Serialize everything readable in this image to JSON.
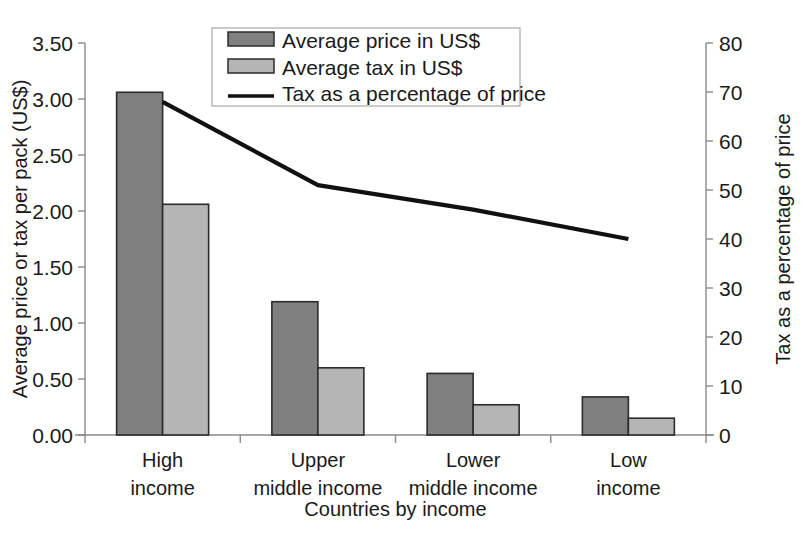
{
  "chart_data": {
    "type": "bar",
    "title": "",
    "subtitle": "",
    "xlabel": "Countries by income",
    "ylabel": "Average price or tax per pack (US$)",
    "y2label": "Tax as a percentage of price",
    "categories": [
      "High\nincome",
      "Upper\nmiddle income",
      "Lower\nmiddle income",
      "Low\nincome"
    ],
    "category_lines": [
      [
        "High",
        "income"
      ],
      [
        "Upper",
        "middle income"
      ],
      [
        "Lower",
        "middle income"
      ],
      [
        "Low",
        "income"
      ]
    ],
    "series": [
      {
        "name": "Average price in US$",
        "type": "bar",
        "axis": "left",
        "values": [
          3.06,
          1.19,
          0.55,
          0.34
        ],
        "color": "#808080"
      },
      {
        "name": "Average tax in US$",
        "type": "bar",
        "axis": "left",
        "values": [
          2.06,
          0.6,
          0.27,
          0.15
        ],
        "color": "#b5b5b5"
      },
      {
        "name": "Tax as a percentage of price",
        "type": "line",
        "axis": "right",
        "values": [
          68,
          51,
          46,
          40
        ],
        "color": "#111111"
      }
    ],
    "ylim": [
      0,
      3.5
    ],
    "yticks": [
      0.0,
      0.5,
      1.0,
      1.5,
      2.0,
      2.5,
      3.0,
      3.5
    ],
    "ytick_labels": [
      "0.00",
      "0.50",
      "1.00",
      "1.50",
      "2.00",
      "2.50",
      "3.00",
      "3.50"
    ],
    "y2lim": [
      0,
      80
    ],
    "y2ticks": [
      0,
      10,
      20,
      30,
      40,
      50,
      60,
      70,
      80
    ],
    "y2tick_labels": [
      "0",
      "10",
      "20",
      "30",
      "40",
      "50",
      "60",
      "70",
      "80"
    ],
    "grid": false,
    "legend_position": "top-center"
  },
  "legend": {
    "items": [
      {
        "label": "Average price in US$",
        "marker": "bar-swatch-dark"
      },
      {
        "label": "Average tax in US$",
        "marker": "bar-swatch-light"
      },
      {
        "label": "Tax as a percentage of price",
        "marker": "line-swatch"
      }
    ]
  },
  "axes": {
    "left_title": "Average price or tax per pack (US$)",
    "right_title": "Tax as a percentage of price",
    "bottom_title": "Countries by income"
  },
  "colors": {
    "price_bar": "#808080",
    "tax_bar": "#b5b5b5",
    "line": "#111111",
    "axis": "#8a8a8a",
    "text": "#1a1a1a",
    "background": "#ffffff"
  }
}
